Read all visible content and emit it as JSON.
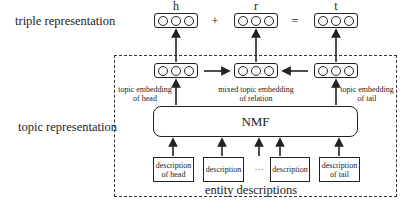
{
  "diagram": {
    "row_labels": {
      "triple": "triple representation",
      "topic": "topic representation"
    },
    "triple_row": {
      "head_label": "h",
      "relation_label": "r",
      "tail_label": "t",
      "plus": "+",
      "equals": "="
    },
    "embedding_row": {
      "head_line1": "topic embedding",
      "head_line2": "of head",
      "relation_line1": "mixed topic embedding",
      "relation_line2": "of relation",
      "tail_line1": "topic embedding",
      "tail_line2": "of tail"
    },
    "model": {
      "label": "NMF"
    },
    "descriptions": {
      "head_line1": "description",
      "head_line2": "of head",
      "middle1": "description",
      "ellipsis": "···",
      "middle2": "description",
      "tail_line1": "description",
      "tail_line2": "of tail",
      "group_label": "entity descriptions"
    }
  }
}
